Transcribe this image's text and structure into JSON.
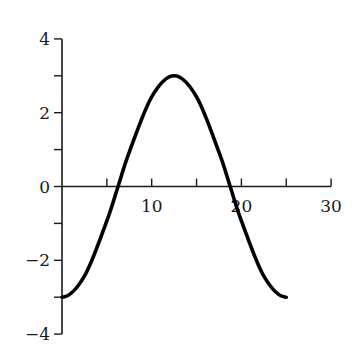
{
  "chart_data": {
    "type": "line",
    "title": "",
    "xlabel": "",
    "ylabel": "",
    "xlim": [
      0,
      30
    ],
    "ylim": [
      -4,
      4
    ],
    "grid": false,
    "legend": null,
    "x_ticks_major": [
      10,
      20,
      30
    ],
    "x_tick_labels": [
      "10",
      "20",
      "30"
    ],
    "x_ticks_minor": [
      5,
      15,
      25
    ],
    "y_ticks_major": [
      -4,
      -2,
      0,
      2,
      4
    ],
    "y_tick_labels": [
      "−4",
      "−2",
      "0",
      "2",
      "4"
    ],
    "y_ticks_minor": [
      -3,
      -1,
      1,
      3
    ],
    "series": [
      {
        "name": "curve",
        "color": "#000000",
        "description": "y = -3 cos(2πx/25), x from 0 to 25",
        "x": [
          0,
          2.5,
          5,
          6.25,
          7.5,
          10,
          12.5,
          15,
          17.5,
          18.75,
          20,
          22.5,
          25
        ],
        "y": [
          -3,
          -2.43,
          -0.93,
          0,
          0.93,
          2.43,
          3,
          2.43,
          0.93,
          0,
          -0.93,
          -2.43,
          -3
        ]
      }
    ]
  },
  "plot": {
    "origin_px": [
      62,
      186.5
    ],
    "x_px_per_unit": 8.97,
    "y_px_per_unit": 36.9
  }
}
